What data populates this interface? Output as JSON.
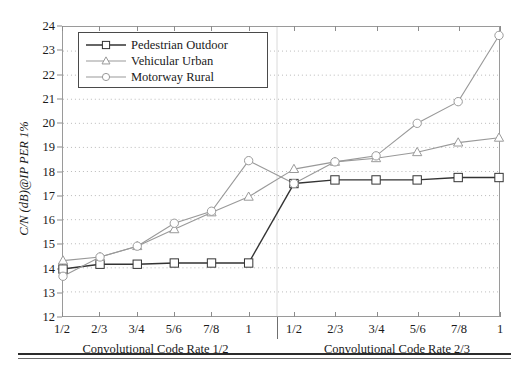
{
  "figure": {
    "background": "#ffffff",
    "frame_color": "#9a9a9a"
  },
  "chart_data": {
    "type": "line",
    "title": "",
    "subtitle": "",
    "xlabel": "",
    "ylabel": "C/N (dB)@IP PER 1%",
    "ylim": [
      12,
      24
    ],
    "ytick_labels": [
      "12",
      "13",
      "14",
      "15",
      "16",
      "17",
      "18",
      "19",
      "20",
      "21",
      "22",
      "23",
      "24"
    ],
    "yticks": [
      12,
      13,
      14,
      15,
      16,
      17,
      18,
      19,
      20,
      21,
      22,
      23,
      24
    ],
    "grid": true,
    "grid_style": "dotted-horizontal",
    "grid_color": "#b9b9b9",
    "legend_position": "top-left",
    "panels": [
      {
        "name": "left-panel",
        "label": "Convolutional Code Rate 1/2",
        "categories": [
          "1/2",
          "2/3",
          "3/4",
          "5/6",
          "7/8",
          "1"
        ]
      },
      {
        "name": "right-panel",
        "label": "Convolutional Code Rate 2/3",
        "categories": [
          "1/2",
          "2/3",
          "3/4",
          "5/6",
          "7/8",
          "1"
        ]
      }
    ],
    "categories": [
      "1/2",
      "2/3",
      "3/4",
      "5/6",
      "7/8",
      "1",
      "1/2",
      "2/3",
      "3/4",
      "5/6",
      "7/8",
      "1"
    ],
    "series": [
      {
        "name": "Pedestrian Outdoor",
        "marker": "square",
        "color": "#333333",
        "values": [
          13.95,
          14.15,
          14.15,
          14.2,
          14.2,
          14.2,
          17.5,
          17.65,
          17.65,
          17.65,
          17.75,
          17.75
        ]
      },
      {
        "name": "Vehicular Urban",
        "marker": "triangle",
        "color": "#999999",
        "values": [
          14.3,
          14.45,
          14.9,
          15.6,
          16.3,
          16.95,
          18.1,
          18.4,
          18.55,
          18.8,
          19.2,
          19.4
        ]
      },
      {
        "name": "Motorway Rural",
        "marker": "circle",
        "color": "#999999",
        "values": [
          13.65,
          14.45,
          14.9,
          15.85,
          16.35,
          18.45,
          17.5,
          18.4,
          18.65,
          20.0,
          20.9,
          23.65
        ]
      }
    ]
  },
  "legend": {
    "items": [
      {
        "label": "Pedestrian Outdoor",
        "marker": "square",
        "color": "#333333"
      },
      {
        "label": "Vehicular Urban",
        "marker": "triangle",
        "color": "#999999"
      },
      {
        "label": "Motorway Rural",
        "marker": "circle",
        "color": "#999999"
      }
    ]
  }
}
